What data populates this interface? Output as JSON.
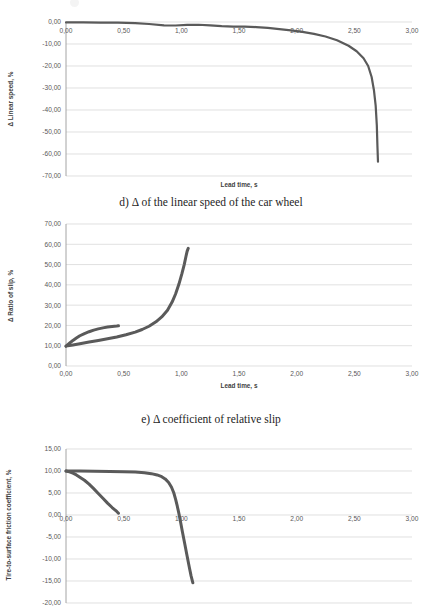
{
  "document": {
    "figure_captions": [
      {
        "id": "d",
        "text": "d) Δ of the linear speed of the car wheel"
      },
      {
        "id": "e",
        "text": "e) Δ coefficient of relative slip"
      }
    ]
  },
  "chart_data": [
    {
      "id": "chart-d",
      "type": "line",
      "title": "",
      "xlabel": "Lead time, s",
      "ylabel": "Δ Linear speed, %",
      "xlim": [
        0,
        3
      ],
      "ylim": [
        -70,
        0
      ],
      "xticks": [
        "0,00",
        "0,50",
        "1,00",
        "1,50",
        "2,00",
        "2,50",
        "3,00"
      ],
      "xtick_values": [
        0,
        0.5,
        1.0,
        1.5,
        2.0,
        2.5,
        3.0
      ],
      "yticks": [
        "0,00",
        "-10,00",
        "-20,00",
        "-30,00",
        "-40,00",
        "-50,00",
        "-60,00",
        "-70,00"
      ],
      "ytick_values": [
        0,
        -10,
        -20,
        -30,
        -40,
        -50,
        -60,
        -70
      ],
      "grid": true,
      "legend": "none",
      "series": [
        {
          "name": "delta linear speed",
          "color": "#595959",
          "width": 2.2,
          "x": [
            0.0,
            0.15,
            0.3,
            0.45,
            0.6,
            0.72,
            0.85,
            0.95,
            1.05,
            1.15,
            1.25,
            1.35,
            1.45,
            1.55,
            1.65,
            1.75,
            1.85,
            1.95,
            2.05,
            2.15,
            2.25,
            2.35,
            2.45,
            2.52,
            2.58,
            2.62,
            2.65,
            2.67,
            2.685,
            2.695,
            2.7,
            2.705
          ],
          "y": [
            -0.2,
            -0.2,
            -0.25,
            -0.3,
            -0.5,
            -0.9,
            -1.5,
            -1.6,
            -1.3,
            -1.25,
            -1.5,
            -1.9,
            -2.1,
            -2.1,
            -2.3,
            -2.7,
            -3.2,
            -3.8,
            -4.5,
            -5.4,
            -6.6,
            -8.3,
            -10.8,
            -13.3,
            -16.5,
            -20.0,
            -25.0,
            -31.0,
            -38.0,
            -47.0,
            -56.0,
            -63.5
          ]
        }
      ]
    },
    {
      "id": "chart-e",
      "type": "line",
      "title": "",
      "xlabel": "Lead time, s",
      "ylabel": "Δ Ratio of slip, %",
      "xlim": [
        0,
        3
      ],
      "ylim": [
        0,
        70
      ],
      "xticks": [
        "0,00",
        "0,50",
        "1,00",
        "1,50",
        "2,00",
        "2,50",
        "3,00"
      ],
      "xtick_values": [
        0,
        0.5,
        1.0,
        1.5,
        2.0,
        2.5,
        3.0
      ],
      "yticks": [
        "70,00",
        "60,00",
        "50,00",
        "40,00",
        "30,00",
        "20,00",
        "10,00",
        "0,00"
      ],
      "ytick_values": [
        70,
        60,
        50,
        40,
        30,
        20,
        10,
        0
      ],
      "grid": true,
      "legend": "none",
      "series": [
        {
          "name": "slip short branch",
          "color": "#5f5f5f",
          "width": 3.0,
          "x": [
            0.0,
            0.03,
            0.06,
            0.09,
            0.12,
            0.16,
            0.2,
            0.24,
            0.28,
            0.32,
            0.36,
            0.4,
            0.44,
            0.455
          ],
          "y": [
            9.8,
            11.2,
            12.6,
            13.8,
            14.9,
            16.0,
            16.9,
            17.7,
            18.3,
            18.8,
            19.2,
            19.5,
            19.7,
            19.8
          ]
        },
        {
          "name": "slip long branch",
          "color": "#5f5f5f",
          "width": 3.0,
          "x": [
            0.0,
            0.06,
            0.12,
            0.2,
            0.28,
            0.36,
            0.44,
            0.52,
            0.6,
            0.66,
            0.72,
            0.78,
            0.83,
            0.88,
            0.92,
            0.95,
            0.98,
            1.005,
            1.025,
            1.04,
            1.05,
            1.06
          ],
          "y": [
            9.8,
            10.4,
            11.0,
            11.8,
            12.6,
            13.4,
            14.3,
            15.4,
            16.7,
            18.0,
            19.6,
            21.8,
            24.2,
            27.5,
            31.5,
            35.5,
            40.5,
            45.5,
            50.0,
            54.0,
            56.5,
            58.0
          ]
        }
      ]
    },
    {
      "id": "chart-f",
      "type": "line",
      "title": "",
      "xlabel": "Lead time, s",
      "ylabel": "Tire-to-surface friction coefficient, %",
      "xlim": [
        0,
        3
      ],
      "ylim": [
        -20,
        15
      ],
      "xticks": [
        "0,00",
        "0,50",
        "1,00",
        "1,50",
        "2,00",
        "2,50",
        "3,00"
      ],
      "xtick_values": [
        0,
        0.5,
        1.0,
        1.5,
        2.0,
        2.5,
        3.0
      ],
      "yticks": [
        "15,00",
        "10,00",
        "5,00",
        "0,00",
        "-5,00",
        "-10,00",
        "-15,00",
        "-20,00"
      ],
      "ytick_values": [
        15,
        10,
        5,
        0,
        -5,
        -10,
        -15,
        -20
      ],
      "grid": true,
      "legend": "none",
      "series": [
        {
          "name": "friction short branch",
          "color": "#5f5f5f",
          "width": 3.0,
          "x": [
            0.0,
            0.03,
            0.06,
            0.09,
            0.12,
            0.16,
            0.2,
            0.24,
            0.28,
            0.32,
            0.36,
            0.4,
            0.44,
            0.455
          ],
          "y": [
            10.0,
            9.8,
            9.5,
            9.1,
            8.6,
            7.9,
            7.0,
            6.0,
            4.9,
            3.8,
            2.7,
            1.7,
            0.8,
            0.4
          ]
        },
        {
          "name": "friction long branch",
          "color": "#5f5f5f",
          "width": 3.0,
          "x": [
            0.0,
            0.12,
            0.25,
            0.38,
            0.5,
            0.6,
            0.68,
            0.74,
            0.79,
            0.83,
            0.86,
            0.89,
            0.915,
            0.935,
            0.95,
            0.965,
            0.98,
            0.995,
            1.01,
            1.03,
            1.05,
            1.07,
            1.085,
            1.1
          ],
          "y": [
            10.0,
            10.0,
            9.95,
            9.9,
            9.85,
            9.75,
            9.6,
            9.4,
            9.1,
            8.7,
            8.2,
            7.4,
            6.3,
            5.0,
            3.6,
            2.0,
            0.2,
            -1.8,
            -3.9,
            -6.6,
            -9.3,
            -12.0,
            -13.9,
            -15.4
          ]
        }
      ]
    }
  ]
}
